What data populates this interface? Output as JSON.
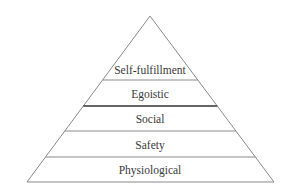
{
  "diagram": {
    "type": "pyramid",
    "levels": [
      {
        "label": "Self-fulfillment"
      },
      {
        "label": "Egoistic"
      },
      {
        "label": "Social"
      },
      {
        "label": "Safety"
      },
      {
        "label": "Physiological"
      }
    ],
    "colors": {
      "line": "#8a8a8a",
      "emphasis_line": "#333333",
      "text": "#3a3a3a",
      "background": "#ffffff"
    }
  }
}
